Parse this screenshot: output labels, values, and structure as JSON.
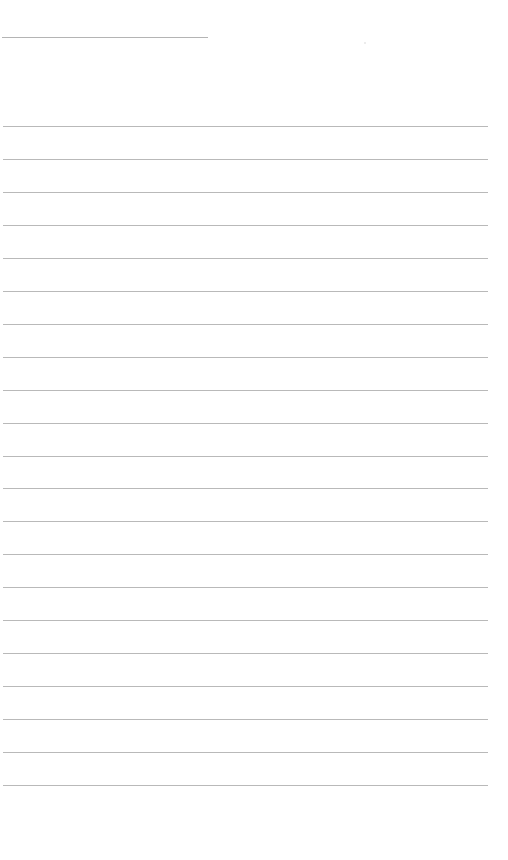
{
  "page": {
    "type": "lined-paper",
    "background": "#ffffff",
    "line_color": "#b9b9b9",
    "header_line": {
      "x": 2,
      "y": 37,
      "width": 206
    },
    "rules": {
      "count": 21,
      "first_y": 126,
      "spacing": 32.95,
      "x": 3,
      "width": 485
    }
  }
}
